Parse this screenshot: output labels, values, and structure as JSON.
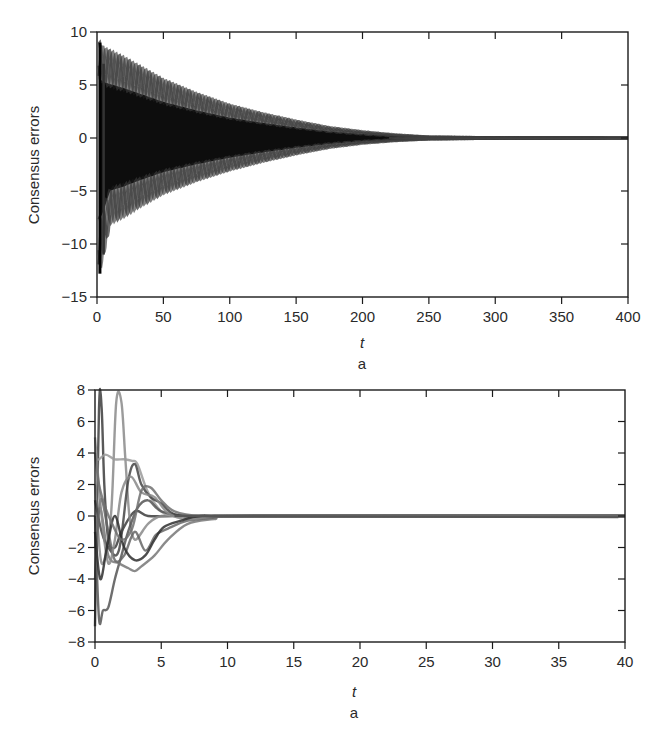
{
  "chart_data": [
    {
      "type": "line",
      "panel": "top",
      "title": "",
      "caption": "a",
      "xlabel": "t",
      "ylabel": "Consensus errors",
      "xlim": [
        0,
        400
      ],
      "ylim": [
        -15,
        10
      ],
      "xticks": [
        0,
        50,
        100,
        150,
        200,
        250,
        300,
        350,
        400
      ],
      "yticks": [
        -15,
        -10,
        -5,
        0,
        5,
        10
      ],
      "xtick_labels": [
        "0",
        "50",
        "100",
        "150",
        "200",
        "250",
        "300",
        "350",
        "400"
      ],
      "ytick_labels": [
        "−15",
        "−10",
        "−5",
        "0",
        "5",
        "10"
      ],
      "grid": false,
      "legend": null,
      "description": "Many overlapping oscillating error trajectories forming a decaying envelope; converge to 0 by t≈250",
      "envelope": {
        "t": [
          0,
          2,
          5,
          10,
          20,
          30,
          50,
          75,
          100,
          125,
          150,
          175,
          200,
          225,
          250,
          300,
          400
        ],
        "upper": [
          9,
          9,
          8.5,
          8.2,
          7.6,
          6.9,
          5.5,
          4.2,
          3.1,
          2.3,
          1.6,
          1.0,
          0.6,
          0.3,
          0.1,
          0.03,
          0
        ],
        "lower": [
          -12.8,
          -12.5,
          -11,
          -8,
          -7.4,
          -6.6,
          -5.2,
          -4.0,
          -3.0,
          -2.2,
          -1.5,
          -0.9,
          -0.5,
          -0.25,
          -0.1,
          -0.03,
          0
        ]
      },
      "oscillation_period": 7.5
    },
    {
      "type": "line",
      "panel": "bottom",
      "title": "",
      "caption": "a",
      "xlabel": "t",
      "ylabel": "Consensus errors",
      "xlim": [
        0,
        40
      ],
      "ylim": [
        -8,
        8
      ],
      "xticks": [
        0,
        5,
        10,
        15,
        20,
        25,
        30,
        35,
        40
      ],
      "yticks": [
        -8,
        -6,
        -4,
        -2,
        0,
        2,
        4,
        6,
        8
      ],
      "xtick_labels": [
        "0",
        "5",
        "10",
        "15",
        "20",
        "25",
        "30",
        "35",
        "40"
      ],
      "ytick_labels": [
        "−8",
        "−6",
        "−4",
        "−2",
        "0",
        "2",
        "4",
        "6",
        "8"
      ],
      "grid": false,
      "legend": null,
      "description": "Multiple agent error trajectories with large transients up to ~7.2 and down to ~-6.5 before t≈5, converging to ~0 by t≈12",
      "series": [
        {
          "name": "e1",
          "x": [
            0,
            0.3,
            0.5,
            0.7,
            1.0,
            1.5,
            2,
            3,
            4,
            6,
            8,
            12,
            40
          ],
          "y": [
            -7,
            6.8,
            6.9,
            2,
            -1.5,
            -2,
            -1,
            0.3,
            0,
            0,
            0,
            0,
            0
          ]
        },
        {
          "name": "e2",
          "x": [
            0,
            0.5,
            1.2,
            1.6,
            2.0,
            2.3,
            2.6,
            3,
            4,
            5,
            7,
            12,
            40
          ],
          "y": [
            2,
            -3,
            0,
            7.2,
            7.2,
            3.5,
            0,
            -1.5,
            -0.5,
            0,
            0,
            0,
            0
          ]
        },
        {
          "name": "e3",
          "x": [
            0,
            0.3,
            0.8,
            1.5,
            2.2,
            2.8,
            3.2,
            4,
            5,
            6,
            8,
            12,
            40
          ],
          "y": [
            3.6,
            3.6,
            3.9,
            3.6,
            3.6,
            3.5,
            3.3,
            1.5,
            0.3,
            0,
            0,
            0,
            0
          ]
        },
        {
          "name": "e4",
          "x": [
            0,
            0.3,
            0.6,
            1.0,
            1.5,
            2,
            2.5,
            3.2,
            4,
            5,
            7,
            10,
            40
          ],
          "y": [
            0,
            -6.5,
            -6,
            -5.8,
            -4,
            -2.5,
            -1,
            0.5,
            1,
            0.3,
            0,
            0,
            0
          ]
        },
        {
          "name": "e5",
          "x": [
            0,
            0.4,
            1.0,
            1.8,
            2.5,
            3.0,
            3.5,
            4.5,
            5.5,
            7,
            9,
            12,
            40
          ],
          "y": [
            -2,
            0.5,
            -2.5,
            -3,
            -3.3,
            -3.5,
            -3.2,
            -2.5,
            -1.5,
            -0.5,
            -0.2,
            0,
            0
          ]
        },
        {
          "name": "e6",
          "x": [
            0,
            0.5,
            1.0,
            1.8,
            2.5,
            3.0,
            3.5,
            4.2,
            5,
            6,
            8,
            12,
            40
          ],
          "y": [
            1,
            -1,
            -2,
            -2.2,
            2.2,
            3.3,
            2,
            1.2,
            0.8,
            0.1,
            0,
            0,
            0
          ]
        },
        {
          "name": "e7",
          "x": [
            0,
            0.4,
            1.0,
            1.5,
            2.2,
            3.0,
            3.8,
            4.6,
            5.5,
            7,
            9,
            12,
            40
          ],
          "y": [
            -4,
            1,
            -1,
            -2.8,
            -2.5,
            -1,
            -2.2,
            -1.2,
            -0.8,
            -0.3,
            -0.1,
            0,
            0
          ]
        },
        {
          "name": "e8",
          "x": [
            0,
            0.5,
            1.0,
            1.5,
            2.0,
            2.7,
            3.5,
            4.5,
            5.5,
            7,
            9,
            12,
            40
          ],
          "y": [
            5,
            0,
            -3,
            -1.5,
            1.5,
            2.5,
            1.5,
            1.2,
            0.2,
            -0.2,
            0,
            0,
            0
          ]
        },
        {
          "name": "e9",
          "x": [
            0,
            0.4,
            0.9,
            1.5,
            2.2,
            3.0,
            3.8,
            4.5,
            5.2,
            6.5,
            8,
            12,
            40
          ],
          "y": [
            -1,
            -4,
            -2,
            0,
            -2,
            -2.8,
            -2.5,
            -1.5,
            -0.7,
            -0.3,
            0,
            0,
            0
          ]
        },
        {
          "name": "e10",
          "x": [
            0,
            0.3,
            0.8,
            1.3,
            2.0,
            2.8,
            3.5,
            4.2,
            5,
            6,
            8,
            12,
            40
          ],
          "y": [
            4,
            2,
            0.5,
            -0.5,
            -1.5,
            -0.8,
            1.6,
            1.8,
            1,
            0.3,
            0,
            0,
            0
          ]
        }
      ]
    }
  ],
  "figure": {
    "panels": [
      {
        "ylabel": "Consensus errors",
        "xlabel": "t",
        "caption": "a",
        "xtick_labels": [
          "0",
          "50",
          "100",
          "150",
          "200",
          "250",
          "300",
          "350",
          "400"
        ],
        "ytick_labels": [
          "10",
          "5",
          "0",
          "−5",
          "−10",
          "−15"
        ]
      },
      {
        "ylabel": "Consensus errors",
        "xlabel": "t",
        "caption": "a",
        "xtick_labels": [
          "0",
          "5",
          "10",
          "15",
          "20",
          "25",
          "30",
          "35",
          "40"
        ],
        "ytick_labels": [
          "8",
          "6",
          "4",
          "2",
          "0",
          "−2",
          "−4",
          "−6",
          "−8"
        ]
      }
    ],
    "colors": {
      "axis": "#1a1a1a",
      "dense_trace": "#111111",
      "trace": "#555555",
      "background": "#ffffff"
    }
  }
}
